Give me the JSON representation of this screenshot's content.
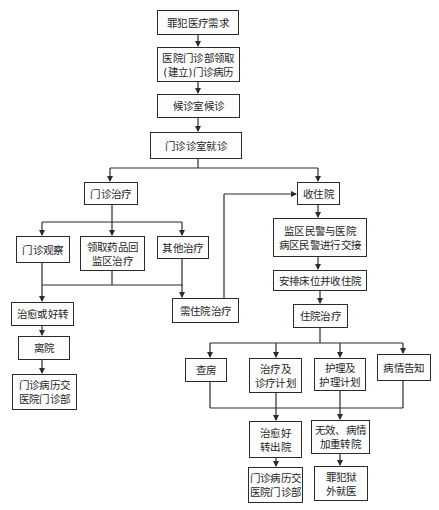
{
  "diagram": {
    "type": "flowchart",
    "nodes": {
      "n1": {
        "lines": [
          "罪犯医疗需求"
        ]
      },
      "n2": {
        "lines": [
          "医院门诊部领取",
          "(建立)门诊病历"
        ]
      },
      "n3": {
        "lines": [
          "候诊室候诊"
        ]
      },
      "n4": {
        "lines": [
          "门诊诊室就诊"
        ]
      },
      "n5": {
        "lines": [
          "门诊治疗"
        ]
      },
      "n6": {
        "lines": [
          "收住院"
        ]
      },
      "n7": {
        "lines": [
          "门诊观察"
        ]
      },
      "n8": {
        "lines": [
          "领取药品回",
          "监区治疗"
        ]
      },
      "n9": {
        "lines": [
          "其他治疗"
        ]
      },
      "n10": {
        "lines": [
          "监区民警与医院",
          "病区民警进行交接"
        ]
      },
      "n11": {
        "lines": [
          "安排床位并收住院"
        ]
      },
      "n12": {
        "lines": [
          "治愈或好转"
        ]
      },
      "n13": {
        "lines": [
          "需住院治疗"
        ]
      },
      "n14": {
        "lines": [
          "离院"
        ]
      },
      "n15": {
        "lines": [
          "门诊病历交",
          "医院门诊部"
        ]
      },
      "n16": {
        "lines": [
          "住院治疗"
        ]
      },
      "n17": {
        "lines": [
          "查房"
        ]
      },
      "n18": {
        "lines": [
          "治疗及",
          "诊疗计划"
        ]
      },
      "n19": {
        "lines": [
          "护理及",
          "护理计划"
        ]
      },
      "n20": {
        "lines": [
          "病情告知"
        ]
      },
      "n21": {
        "lines": [
          "治愈好",
          "转出院"
        ]
      },
      "n22": {
        "lines": [
          "无效、病情",
          "加重转院"
        ]
      },
      "n23": {
        "lines": [
          "门诊病历交",
          "医院门诊部"
        ]
      },
      "n24": {
        "lines": [
          "罪犯狱",
          "外就医"
        ]
      }
    },
    "edges": [
      [
        "n1",
        "n2"
      ],
      [
        "n2",
        "n3"
      ],
      [
        "n3",
        "n4"
      ],
      [
        "n4",
        "n5"
      ],
      [
        "n4",
        "n6"
      ],
      [
        "n5",
        "n7"
      ],
      [
        "n5",
        "n8"
      ],
      [
        "n5",
        "n9"
      ],
      [
        "n7",
        "n12"
      ],
      [
        "n8",
        "n12"
      ],
      [
        "n8",
        "n13"
      ],
      [
        "n9",
        "n13"
      ],
      [
        "n12",
        "n14"
      ],
      [
        "n14",
        "n15"
      ],
      [
        "n13",
        "n6"
      ],
      [
        "n6",
        "n10"
      ],
      [
        "n10",
        "n11"
      ],
      [
        "n11",
        "n16"
      ],
      [
        "n16",
        "n17"
      ],
      [
        "n16",
        "n18"
      ],
      [
        "n16",
        "n19"
      ],
      [
        "n16",
        "n20"
      ],
      [
        "n17",
        "n21"
      ],
      [
        "n18",
        "n21"
      ],
      [
        "n19",
        "n22"
      ],
      [
        "n20",
        "n22"
      ],
      [
        "n21",
        "n23"
      ],
      [
        "n22",
        "n24"
      ]
    ],
    "colors": {
      "line": "#2b2b2b",
      "box_border": "#2b2b2b",
      "background": "#ffffff",
      "text": "#1e1e1e"
    }
  }
}
